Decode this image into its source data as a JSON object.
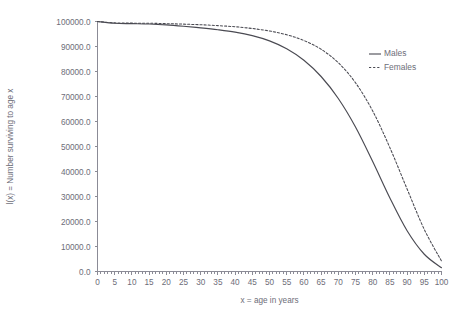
{
  "chart_data": {
    "type": "line",
    "title": "",
    "xlabel": "x = age in years",
    "ylabel": "l(x) = Number surviving to age x",
    "xlim": [
      0,
      100
    ],
    "ylim": [
      0,
      100000
    ],
    "grid": false,
    "legend_position": "top-right",
    "x_ticks": [
      0,
      5,
      10,
      15,
      20,
      25,
      30,
      35,
      40,
      45,
      50,
      55,
      60,
      65,
      70,
      75,
      80,
      85,
      90,
      95,
      100
    ],
    "x_tick_labels": [
      "0",
      "5",
      "10",
      "15",
      "20",
      "25",
      "30",
      "35",
      "40",
      "45",
      "50",
      "55",
      "60",
      "65",
      "70",
      "75",
      "80",
      "85",
      "90",
      "95",
      "100"
    ],
    "y_ticks": [
      0,
      10000,
      20000,
      30000,
      40000,
      50000,
      60000,
      70000,
      80000,
      90000,
      100000
    ],
    "y_tick_labels": [
      "0.0",
      "10000.0",
      "20000.0",
      "30000.0",
      "40000.0",
      "50000.0",
      "60000.0",
      "70000.0",
      "80000.0",
      "90000.0",
      "100000.0"
    ],
    "x": [
      0,
      5,
      10,
      15,
      20,
      25,
      30,
      35,
      40,
      45,
      50,
      55,
      60,
      65,
      70,
      75,
      80,
      85,
      90,
      95,
      100
    ],
    "series": [
      {
        "name": "Males",
        "style": "solid",
        "color": "#4a4a52",
        "values": [
          100000,
          99300,
          99150,
          99000,
          98650,
          98100,
          97450,
          96700,
          95750,
          94350,
          92250,
          89100,
          84500,
          78000,
          69200,
          57800,
          44000,
          29400,
          16300,
          6900,
          1500
        ]
      },
      {
        "name": "Females",
        "style": "dashed",
        "color": "#4a4a52",
        "values": [
          100000,
          99450,
          99350,
          99300,
          99150,
          98950,
          98700,
          98350,
          97900,
          97200,
          96200,
          94700,
          92400,
          88900,
          83500,
          75500,
          64200,
          49500,
          33000,
          16800,
          4200
        ]
      }
    ]
  },
  "legend": {
    "entries": [
      {
        "label": "Males"
      },
      {
        "label": "Females"
      }
    ]
  },
  "axes": {
    "x_title": "x = age in years",
    "y_title": "l(x) = Number surviving to age x"
  }
}
